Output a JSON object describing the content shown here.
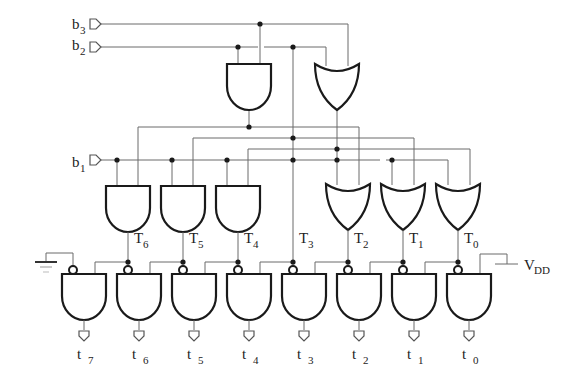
{
  "diagram": {
    "inputs": [
      {
        "id": "b3",
        "base": "b",
        "sub": "3"
      },
      {
        "id": "b2",
        "base": "b",
        "sub": "2"
      },
      {
        "id": "b1",
        "base": "b",
        "sub": "1"
      }
    ],
    "intermediate": [
      {
        "id": "T6",
        "base": "T",
        "sub": "6",
        "gate": "AND"
      },
      {
        "id": "T5",
        "base": "T",
        "sub": "5",
        "gate": "AND"
      },
      {
        "id": "T4",
        "base": "T",
        "sub": "4",
        "gate": "AND"
      },
      {
        "id": "T3",
        "base": "T",
        "sub": "3",
        "gate": "wire"
      },
      {
        "id": "T2",
        "base": "T",
        "sub": "2",
        "gate": "OR"
      },
      {
        "id": "T1",
        "base": "T",
        "sub": "1",
        "gate": "OR"
      },
      {
        "id": "T0",
        "base": "T",
        "sub": "0",
        "gate": "OR"
      }
    ],
    "outputs": [
      {
        "id": "t7",
        "base": "t",
        "sub": "7"
      },
      {
        "id": "t6",
        "base": "t",
        "sub": "6"
      },
      {
        "id": "t5",
        "base": "t",
        "sub": "5"
      },
      {
        "id": "t4",
        "base": "t",
        "sub": "4"
      },
      {
        "id": "t3",
        "base": "t",
        "sub": "3"
      },
      {
        "id": "t2",
        "base": "t",
        "sub": "2"
      },
      {
        "id": "t1",
        "base": "t",
        "sub": "1"
      },
      {
        "id": "t0",
        "base": "t",
        "sub": "0"
      }
    ],
    "supply": {
      "base": "V",
      "sub": "DD"
    },
    "ground": "ground-symbol",
    "top_gates": [
      "AND",
      "OR"
    ]
  }
}
